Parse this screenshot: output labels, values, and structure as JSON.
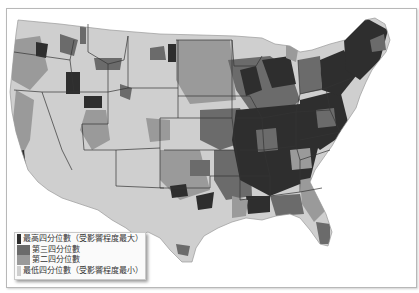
{
  "map": {
    "region": "Contiguous United States",
    "type": "choropleth by quartile",
    "colors": {
      "q4_highest": "#2e2e2e",
      "q3": "#6b6b6b",
      "q2": "#9a9a9a",
      "q1_lowest": "#cfcfcf",
      "borders": "#333333",
      "background": "#ffffff"
    }
  },
  "legend": {
    "items": [
      {
        "label": "最高四分位數（受影響程度最大）",
        "color": "#2e2e2e"
      },
      {
        "label": "第三四分位數",
        "color": "#6b6b6b"
      },
      {
        "label": "第二四分位數",
        "color": "#9a9a9a"
      },
      {
        "label": "最低四分位數（受影響程度最小）",
        "color": "#cfcfcf"
      }
    ]
  }
}
